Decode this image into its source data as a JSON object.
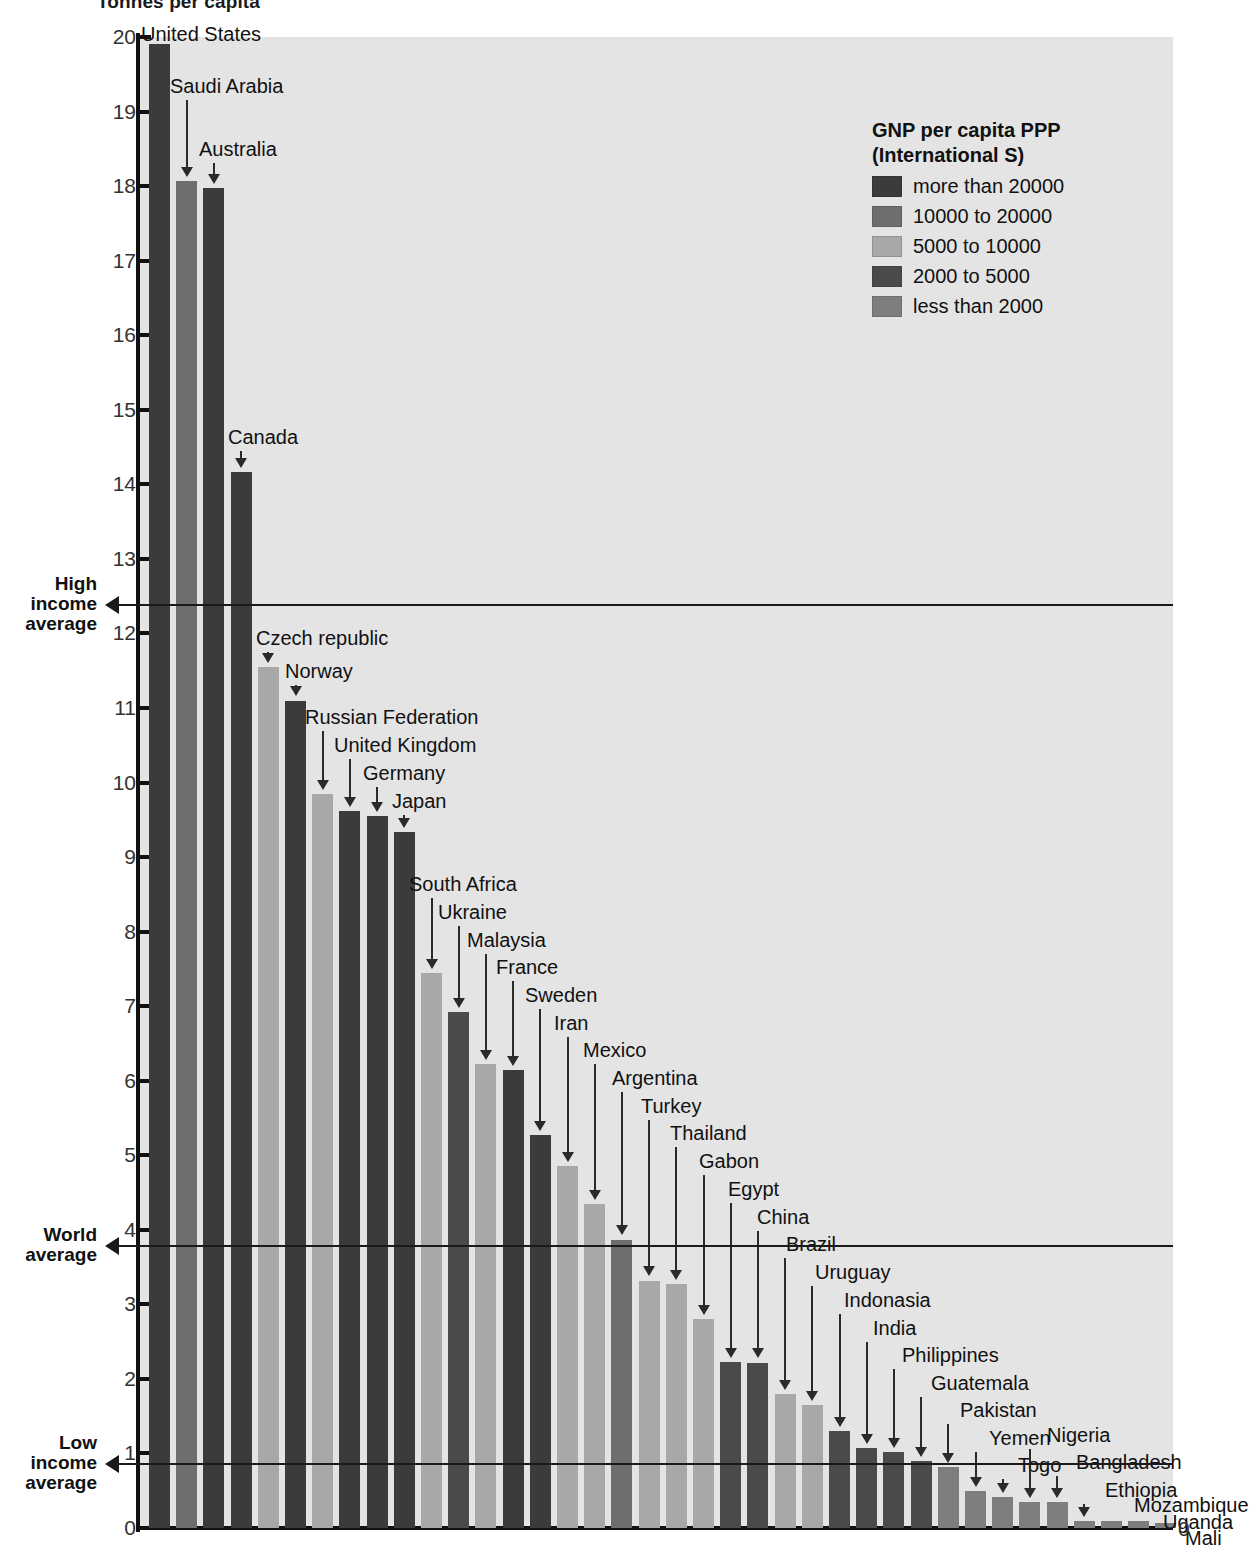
{
  "title": "Tonnes per capita",
  "legend": {
    "title_line1": "GNP per capita PPP",
    "title_line2": "(International S)",
    "items": [
      {
        "label": "more than 20000",
        "color": "#3b3b3b"
      },
      {
        "label": "10000 to 20000",
        "color": "#6e6e6e"
      },
      {
        "label": "5000 to 10000",
        "color": "#a8a8a8"
      },
      {
        "label": "2000 to 5000",
        "color": "#4a4a4a"
      },
      {
        "label": "less than 2000",
        "color": "#7e7e7e"
      }
    ]
  },
  "reference_lines": [
    {
      "name": "high-income-average",
      "label_lines": [
        "High",
        "income",
        "average"
      ],
      "value": 12.4
    },
    {
      "name": "world-average",
      "label_lines": [
        "World",
        "average"
      ],
      "value": 3.8
    },
    {
      "name": "low-income-average",
      "label_lines": [
        "Low",
        "income",
        "average"
      ],
      "value": 0.87
    }
  ],
  "axis": {
    "y_ticks": [
      0,
      1,
      2,
      3,
      4,
      5,
      6,
      7,
      8,
      9,
      10,
      11,
      12,
      13,
      14,
      15,
      16,
      17,
      18,
      19,
      20
    ],
    "y_min": 0,
    "y_max": 20,
    "right_zero_label": "0"
  },
  "chart_data": {
    "type": "bar",
    "title": "Tonnes per capita",
    "xlabel": "",
    "ylabel": "Tonnes per capita",
    "ylim": [
      0,
      20
    ],
    "grid": false,
    "legend_position": "top-right",
    "legend_title": "GNP per capita PPP (International S)",
    "categories": [
      "United States",
      "Saudi Arabia",
      "Australia",
      "Canada",
      "Czech republic",
      "Norway",
      "Russian Federation",
      "United Kingdom",
      "Germany",
      "Japan",
      "South Africa",
      "Ukraine",
      "Malaysia",
      "France",
      "Sweden",
      "Iran",
      "Mexico",
      "Argentina",
      "Turkey",
      "Thailand",
      "Gabon",
      "Egypt",
      "China",
      "Brazil",
      "Uruguay",
      "Indonasia",
      "India",
      "Philippines",
      "Guatemala",
      "Pakistan",
      "Yemen",
      "Togo",
      "Nigeria",
      "Bangladesh",
      "Ethiopia",
      "Mozambique",
      "Uganda",
      "Mali"
    ],
    "values": [
      19.9,
      18.07,
      17.97,
      14.17,
      11.55,
      11.1,
      9.85,
      9.62,
      9.55,
      9.33,
      7.45,
      6.92,
      6.22,
      6.15,
      5.27,
      4.85,
      4.35,
      3.87,
      3.32,
      3.27,
      2.8,
      2.23,
      2.22,
      1.8,
      1.65,
      1.3,
      1.07,
      1.02,
      0.9,
      0.82,
      0.5,
      0.42,
      0.35,
      0.35,
      0.1,
      0.09,
      0.09,
      0.07
    ],
    "income_group": [
      "more than 20000",
      "10000 to 20000",
      "more than 20000",
      "more than 20000",
      "5000 to 10000",
      "more than 20000",
      "5000 to 10000",
      "more than 20000",
      "more than 20000",
      "more than 20000",
      "5000 to 10000",
      "2000 to 5000",
      "5000 to 10000",
      "more than 20000",
      "more than 20000",
      "5000 to 10000",
      "5000 to 10000",
      "10000 to 20000",
      "5000 to 10000",
      "5000 to 10000",
      "5000 to 10000",
      "2000 to 5000",
      "2000 to 5000",
      "5000 to 10000",
      "5000 to 10000",
      "2000 to 5000",
      "2000 to 5000",
      "2000 to 5000",
      "2000 to 5000",
      "less than 2000",
      "less than 2000",
      "less than 2000",
      "less than 2000",
      "less than 2000",
      "less than 2000",
      "less than 2000",
      "less than 2000",
      "less than 2000"
    ],
    "bar_colors": [
      "#3b3b3b",
      "#6e6e6e",
      "#3b3b3b",
      "#3b3b3b",
      "#a8a8a8",
      "#3b3b3b",
      "#a8a8a8",
      "#3b3b3b",
      "#3b3b3b",
      "#3b3b3b",
      "#a8a8a8",
      "#4a4a4a",
      "#a8a8a8",
      "#3b3b3b",
      "#3b3b3b",
      "#a8a8a8",
      "#a8a8a8",
      "#6e6e6e",
      "#a8a8a8",
      "#a8a8a8",
      "#a8a8a8",
      "#4a4a4a",
      "#4a4a4a",
      "#a8a8a8",
      "#a8a8a8",
      "#4a4a4a",
      "#4a4a4a",
      "#4a4a4a",
      "#4a4a4a",
      "#7e7e7e",
      "#7e7e7e",
      "#7e7e7e",
      "#7e7e7e",
      "#7e7e7e",
      "#7e7e7e",
      "#7e7e7e",
      "#7e7e7e",
      "#7e7e7e"
    ],
    "annotations": [
      {
        "country": "United States",
        "label_x": 141,
        "label_y": 24,
        "align": "left"
      },
      {
        "country": "Saudi Arabia",
        "label_x": 170,
        "label_y": 76,
        "align": "left"
      },
      {
        "country": "Australia",
        "label_x": 199,
        "label_y": 139,
        "align": "left"
      },
      {
        "country": "Canada",
        "label_x": 228,
        "label_y": 427,
        "align": "left"
      },
      {
        "country": "Czech republic",
        "label_x": 256,
        "label_y": 628,
        "align": "left"
      },
      {
        "country": "Norway",
        "label_x": 285,
        "label_y": 661,
        "align": "left"
      },
      {
        "country": "Russian Federation",
        "label_x": 305,
        "label_y": 707,
        "align": "left"
      },
      {
        "country": "United Kingdom",
        "label_x": 334,
        "label_y": 735,
        "align": "left"
      },
      {
        "country": "Germany",
        "label_x": 363,
        "label_y": 763,
        "align": "left"
      },
      {
        "country": "Japan",
        "label_x": 392,
        "label_y": 791,
        "align": "left"
      },
      {
        "country": "South Africa",
        "label_x": 409,
        "label_y": 874,
        "align": "left"
      },
      {
        "country": "Ukraine",
        "label_x": 438,
        "label_y": 902,
        "align": "left"
      },
      {
        "country": "Malaysia",
        "label_x": 467,
        "label_y": 930,
        "align": "left"
      },
      {
        "country": "France",
        "label_x": 496,
        "label_y": 957,
        "align": "left"
      },
      {
        "country": "Sweden",
        "label_x": 525,
        "label_y": 985,
        "align": "left"
      },
      {
        "country": "Iran",
        "label_x": 554,
        "label_y": 1013,
        "align": "left"
      },
      {
        "country": "Mexico",
        "label_x": 583,
        "label_y": 1040,
        "align": "left"
      },
      {
        "country": "Argentina",
        "label_x": 612,
        "label_y": 1068,
        "align": "left"
      },
      {
        "country": "Turkey",
        "label_x": 641,
        "label_y": 1096,
        "align": "left"
      },
      {
        "country": "Thailand",
        "label_x": 670,
        "label_y": 1123,
        "align": "left"
      },
      {
        "country": "Gabon",
        "label_x": 699,
        "label_y": 1151,
        "align": "left"
      },
      {
        "country": "Egypt",
        "label_x": 728,
        "label_y": 1179,
        "align": "left"
      },
      {
        "country": "China",
        "label_x": 757,
        "label_y": 1207,
        "align": "left"
      },
      {
        "country": "Brazil",
        "label_x": 786,
        "label_y": 1234,
        "align": "left"
      },
      {
        "country": "Uruguay",
        "label_x": 815,
        "label_y": 1262,
        "align": "left"
      },
      {
        "country": "Indonasia",
        "label_x": 844,
        "label_y": 1290,
        "align": "left"
      },
      {
        "country": "India",
        "label_x": 873,
        "label_y": 1318,
        "align": "left"
      },
      {
        "country": "Philippines",
        "label_x": 902,
        "label_y": 1345,
        "align": "left"
      },
      {
        "country": "Guatemala",
        "label_x": 931,
        "label_y": 1373,
        "align": "left"
      },
      {
        "country": "Pakistan",
        "label_x": 960,
        "label_y": 1400,
        "align": "left"
      },
      {
        "country": "Yemen",
        "label_x": 989,
        "label_y": 1428,
        "align": "left"
      },
      {
        "country": "Togo",
        "label_x": 1018,
        "label_y": 1455,
        "align": "left"
      },
      {
        "country": "Nigeria",
        "label_x": 1047,
        "label_y": 1425,
        "align": "left"
      },
      {
        "country": "Bangladesh",
        "label_x": 1076,
        "label_y": 1452,
        "align": "left"
      },
      {
        "country": "Ethiopia",
        "label_x": 1105,
        "label_y": 1480,
        "align": "left"
      },
      {
        "country": "Mozambique",
        "label_x": 1134,
        "label_y": 1495,
        "align": "left"
      },
      {
        "country": "Uganda",
        "label_x": 1163,
        "label_y": 1512,
        "align": "left"
      },
      {
        "country": "Mali",
        "label_x": 1185,
        "label_y": 1528,
        "align": "left"
      }
    ]
  }
}
